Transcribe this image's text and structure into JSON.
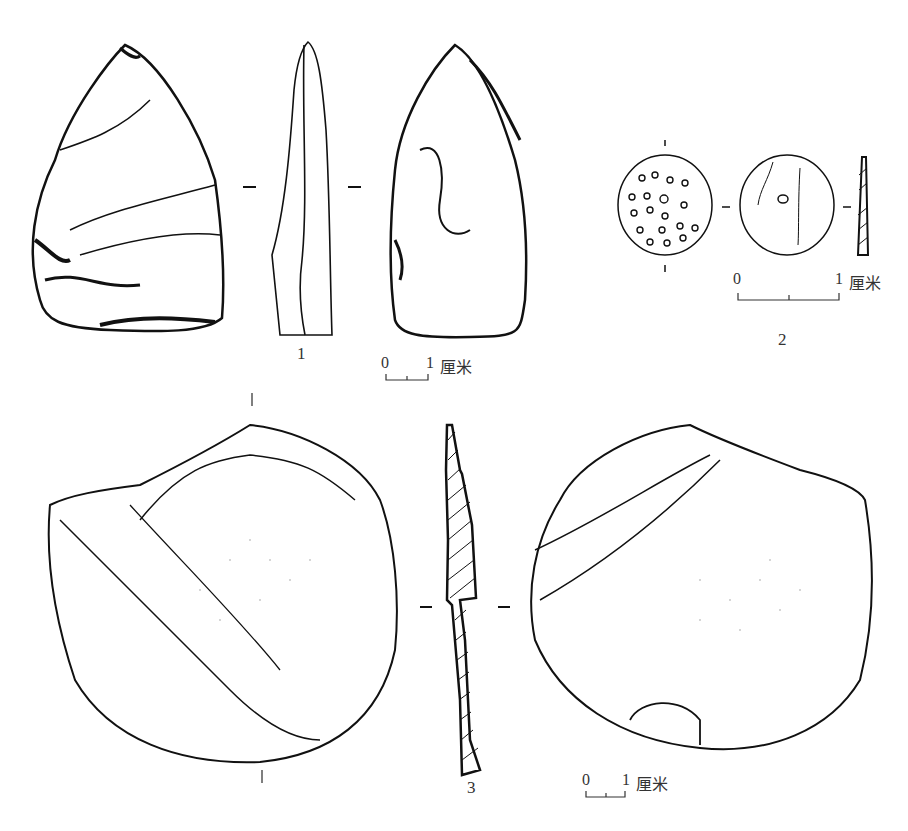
{
  "figure": {
    "artifacts": [
      {
        "id": "1",
        "label": "1",
        "description": "pointed flake tool, dorsal, profile, ventral views"
      },
      {
        "id": "2",
        "label": "2",
        "description": "small perforated disc, two faces and profile"
      },
      {
        "id": "3",
        "label": "3",
        "description": "large flake, two faces and hatched cross-section"
      }
    ],
    "scale_bars": [
      {
        "id": "scale-1",
        "start": "0",
        "end": "1",
        "unit": "厘米"
      },
      {
        "id": "scale-2",
        "start": "0",
        "end": "1",
        "unit": "厘米"
      },
      {
        "id": "scale-3",
        "start": "0",
        "end": "1",
        "unit": "厘米"
      }
    ]
  }
}
